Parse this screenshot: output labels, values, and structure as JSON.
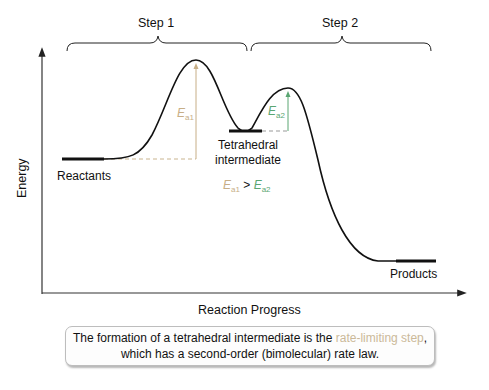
{
  "diagram": {
    "type": "reaction energy profile (two-step)",
    "axes": {
      "ylabel": "Energy",
      "xlabel": "Reaction Progress"
    },
    "steps": [
      {
        "label": "Step 1"
      },
      {
        "label": "Step 2"
      }
    ],
    "states": {
      "reactants": "Reactants",
      "intermediate_line1": "Tetrahedral",
      "intermediate_line2": "intermediate",
      "products": "Products"
    },
    "activation_energies": {
      "ea1": {
        "symbol": "E",
        "subscript": "a1",
        "color": "#c7ae86"
      },
      "ea2": {
        "symbol": "E",
        "subscript": "a2",
        "color": "#5aa672"
      },
      "comparison_operator": ">"
    },
    "callout": {
      "text_before": "The formation of a tetrahedral intermediate is the ",
      "highlight": "rate-limiting step",
      "text_after": ", which has a second-order (bimolecular) rate law."
    },
    "colors": {
      "curve": "#111111",
      "ea1": "#c7ae86",
      "ea2": "#5aa672",
      "dashed": "#c9b48f",
      "highlight_text": "#cbb999"
    }
  }
}
